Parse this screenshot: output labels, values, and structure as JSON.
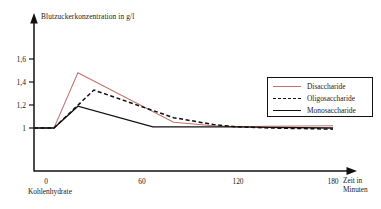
{
  "chart_data": {
    "type": "line",
    "title": "",
    "ylabel": "Blutzuckerkonzentration in g/l",
    "xlabel": "Zeit in Minuten",
    "xlabel_line1": "Zeit in",
    "xlabel_line2": "Minuten",
    "x_origin_caption": "Kohlenhydrate",
    "xlim": [
      0,
      180
    ],
    "ylim": [
      0.82,
      1.72
    ],
    "xticks": [
      0,
      60,
      120,
      180
    ],
    "xtick_labels": [
      "0",
      "60",
      "120",
      "180"
    ],
    "yticks": [
      1,
      1.2,
      1.4,
      1.6
    ],
    "ytick_labels": [
      "1",
      "1,2",
      "1,4",
      "1,6"
    ],
    "grid": false,
    "legend_position": "right",
    "series": [
      {
        "name": "Disaccharide",
        "color": "#c2726f",
        "style": "solid",
        "x": [
          0,
          5,
          20,
          80,
          105,
          120,
          140,
          180
        ],
        "values": [
          1.0,
          1.0,
          1.48,
          1.05,
          1.02,
          1.01,
          1.015,
          1.02
        ]
      },
      {
        "name": "Oligosaccharide",
        "color": "#111111",
        "style": "dashed",
        "x": [
          0,
          5,
          30,
          80,
          105,
          120,
          140,
          180
        ],
        "values": [
          1.0,
          1.0,
          1.33,
          1.09,
          1.03,
          1.01,
          1.0,
          0.99
        ]
      },
      {
        "name": "Monosaccharide",
        "color": "#111111",
        "style": "solid",
        "x": [
          0,
          5,
          20,
          67,
          105,
          120,
          140,
          180
        ],
        "values": [
          1.0,
          1.0,
          1.19,
          1.01,
          1.01,
          1.01,
          1.005,
          1.0
        ]
      }
    ]
  },
  "axes": {
    "y_axis_title": "Blutzuckerkonzentration in g/l",
    "y_tick_1": "1",
    "y_tick_2": "1,2",
    "y_tick_3": "1,4",
    "y_tick_4": "1,6",
    "x_tick_1": "0",
    "x_tick_2": "60",
    "x_tick_3": "120",
    "x_tick_4": "180",
    "x_title_line1": "Zeit in",
    "x_title_line2": "Minuten",
    "origin_caption": "Kohlenhydrate"
  },
  "legend": {
    "items": [
      {
        "label": "Disaccharide"
      },
      {
        "label": "Oligosaccharide"
      },
      {
        "label": "Monosaccharide"
      }
    ]
  }
}
